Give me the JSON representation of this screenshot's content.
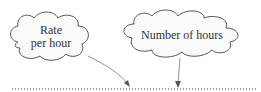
{
  "diagram": {
    "clouds": [
      {
        "id": "rate",
        "lines": [
          "Rate",
          "per hour"
        ]
      },
      {
        "id": "hours",
        "lines": [
          "Number of hours"
        ]
      }
    ],
    "colors": {
      "stroke": "#555555",
      "fill": "#fafafa",
      "dots": "#333333"
    }
  }
}
